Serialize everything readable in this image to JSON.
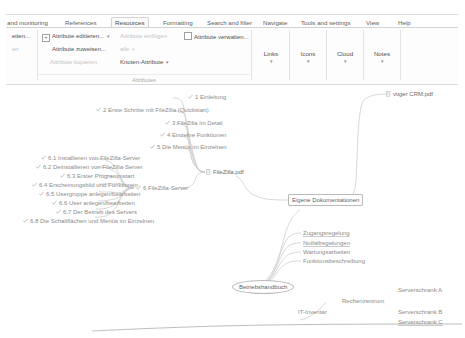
{
  "app": {
    "name": "Freeplane mind map editor"
  },
  "ribbon": {
    "tabs": [
      {
        "label": "and monitoring",
        "active": false,
        "truncated": true
      },
      {
        "label": "References",
        "active": false
      },
      {
        "label": "Resources",
        "active": true
      },
      {
        "label": "Formatting",
        "active": false
      },
      {
        "label": "Search and filter",
        "active": false
      },
      {
        "label": "Navigate",
        "active": false
      },
      {
        "label": "Tools and settings",
        "active": false
      },
      {
        "label": "View",
        "active": false
      },
      {
        "label": "Help",
        "active": false
      }
    ],
    "left_truncated": [
      {
        "label": "eiten...",
        "enabled": true
      },
      {
        "label": "en",
        "enabled": false
      }
    ],
    "attributes_group": {
      "label": "Attributes",
      "items": [
        {
          "label": "Attribute editieren...",
          "enabled": true,
          "checkbox": "+",
          "caret": true
        },
        {
          "label": "Attribute zuweisen...",
          "enabled": true
        },
        {
          "label": "Attribute kopieren",
          "enabled": false
        },
        {
          "label": "Attribute einfügen",
          "enabled": false
        },
        {
          "label": "alle",
          "enabled": false,
          "caret": true
        },
        {
          "label": "Knoten-Attribute",
          "enabled": true,
          "caret": true
        },
        {
          "label": "Attribute verwalten...",
          "enabled": true,
          "checkbox": ""
        }
      ]
    },
    "big_buttons": [
      {
        "label": "Links",
        "caret": "▾"
      },
      {
        "label": "Icons",
        "caret": "▾"
      },
      {
        "label": "Cloud",
        "caret": "▾"
      },
      {
        "label": "Notes",
        "caret": "▾"
      }
    ],
    "collapse_handle": "▬"
  },
  "map": {
    "nodes": [
      {
        "id": "n1",
        "label": "1 Einleitung",
        "icon": "check-icon"
      },
      {
        "id": "n2",
        "label": "2 Erste Schritte mit FileZilla (Quickstart)",
        "icon": "check-icon"
      },
      {
        "id": "n3",
        "label": "3 FileZilla im Detail",
        "icon": "check-icon"
      },
      {
        "id": "n4",
        "label": "4 Einzelne Funktionen",
        "icon": "check-icon"
      },
      {
        "id": "n5",
        "label": "5 Die Menüs im Einzelnen",
        "icon": "check-icon"
      },
      {
        "id": "n61",
        "label": "6.1 Installieren von FileZilla-Server",
        "icon": "check-icon"
      },
      {
        "id": "n62",
        "label": "6.2 Deinstallieren von FileZilla-Server",
        "icon": "check-icon"
      },
      {
        "id": "n63",
        "label": "6.3 Erster Programmstart",
        "icon": "check-icon"
      },
      {
        "id": "n64",
        "label": "6.4 Erscheinungsbild und Funktionen",
        "icon": "check-icon"
      },
      {
        "id": "n65",
        "label": "6.5 Usergruppe anlegen/bearbeiten",
        "icon": "check-icon"
      },
      {
        "id": "n66",
        "label": "6.6 User anlegen/bearbeiten",
        "icon": "check-icon"
      },
      {
        "id": "n67",
        "label": "6.7 Der Betrieb des Servers",
        "icon": "check-icon"
      },
      {
        "id": "n68",
        "label": "6.8 Die Schaltflächen und Menüs im Einzelnen",
        "icon": "check-icon"
      },
      {
        "id": "n6",
        "label": "6 FileZilla-Server",
        "icon": "check-icon"
      },
      {
        "id": "nfz",
        "label": "FileZilla.pdf",
        "icon": "pdf-icon"
      },
      {
        "id": "nvt",
        "label": "vtiger CRM.pdf",
        "icon": "pdf-icon"
      },
      {
        "id": "ned",
        "label": "Eigene Dokumentationen",
        "shape": "box"
      },
      {
        "id": "nzg",
        "label": "Zugangsregelung",
        "underline": true
      },
      {
        "id": "nnf",
        "label": "Notfallregelungen",
        "underline": true
      },
      {
        "id": "nwa",
        "label": "Wartungsarbeiten"
      },
      {
        "id": "nfb",
        "label": "Funktionsbeschreibung"
      },
      {
        "id": "nbh",
        "label": "Betriebshandbuch",
        "shape": "ellipse"
      },
      {
        "id": "nit",
        "label": "IT-Inventar"
      },
      {
        "id": "nrz",
        "label": "Rechenzentrum"
      },
      {
        "id": "nsa",
        "label": "Serverschrank A"
      },
      {
        "id": "nsb",
        "label": "Serverschrank B"
      },
      {
        "id": "nsc",
        "label": "Serverschrank C",
        "underline": true
      }
    ]
  }
}
